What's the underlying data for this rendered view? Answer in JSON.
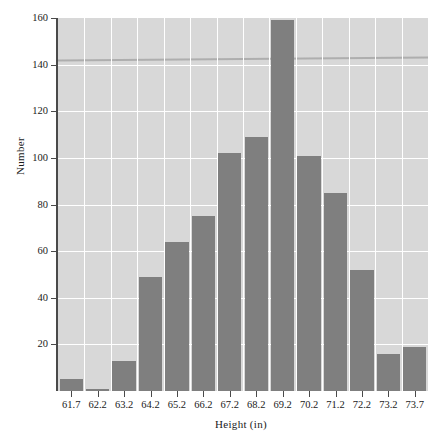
{
  "chart_data": {
    "type": "bar",
    "title": "",
    "subtitle": "",
    "xlabel": "Height (in)",
    "ylabel": "Number",
    "categories": [
      "61.7",
      "62.2",
      "63.2",
      "64.2",
      "65.2",
      "66.2",
      "67.2",
      "68.2",
      "69.2",
      "70.2",
      "71.2",
      "72.2",
      "73.2",
      "73.7"
    ],
    "values": [
      5,
      1,
      13,
      49,
      64,
      75,
      102,
      109,
      159,
      101,
      85,
      52,
      16,
      19
    ],
    "series": [
      {
        "name": "Number",
        "values": [
          5,
          1,
          13,
          49,
          64,
          75,
          102,
          109,
          159,
          101,
          85,
          52,
          16,
          19
        ]
      }
    ],
    "ylim": [
      0,
      160
    ],
    "yticks": [
      20,
      40,
      60,
      80,
      100,
      120,
      140,
      160
    ],
    "ytick_labels": [
      "20",
      "40",
      "60",
      "80",
      "100",
      "120",
      "140",
      "160"
    ],
    "xtick_labels": [
      "61.7",
      "62.2",
      "63.2",
      "64.2",
      "65.2",
      "66.2",
      "67.2",
      "68.2",
      "69.2",
      "70.2",
      "71.2",
      "72.2",
      "73.2",
      "73.7"
    ],
    "grid": true,
    "grid_color": "#ffffff",
    "legend": false,
    "legend_position": "none",
    "bar_color": "#7f7f7f",
    "plot_background": "#d8d8d8",
    "axis_color": "#4a4a4a",
    "annotations": []
  }
}
